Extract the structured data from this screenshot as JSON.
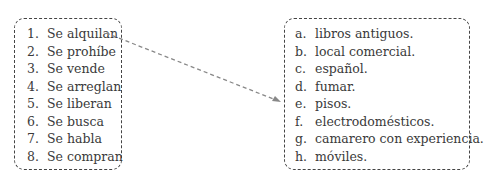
{
  "left_column": {
    "items": [
      {
        "marker": "1.",
        "text": "Se alquilan"
      },
      {
        "marker": "2.",
        "text": "Se prohíbe"
      },
      {
        "marker": "3.",
        "text": "Se vende"
      },
      {
        "marker": "4.",
        "text": "Se arreglan"
      },
      {
        "marker": "5.",
        "text": "Se liberan"
      },
      {
        "marker": "6.",
        "text": "Se busca"
      },
      {
        "marker": "7.",
        "text": "Se habla"
      },
      {
        "marker": "8.",
        "text": "Se compran"
      }
    ]
  },
  "right_column": {
    "items": [
      {
        "marker": "a.",
        "text": "libros antiguos."
      },
      {
        "marker": "b.",
        "text": "local comercial."
      },
      {
        "marker": "c.",
        "text": "español."
      },
      {
        "marker": "d.",
        "text": "fumar."
      },
      {
        "marker": "e.",
        "text": "pisos."
      },
      {
        "marker": "f.",
        "text": "electrodomésticos."
      },
      {
        "marker": "g.",
        "text": "camarero con experiencia."
      },
      {
        "marker": "h.",
        "text": "móviles."
      }
    ]
  },
  "connector": {
    "from": "1",
    "to": "e",
    "color": "#888888"
  }
}
